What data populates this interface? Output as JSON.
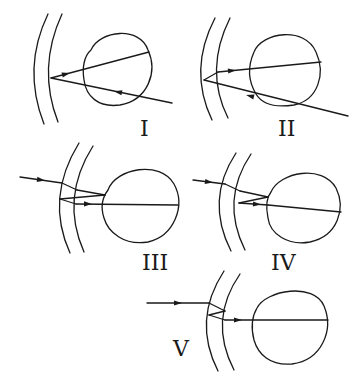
{
  "diagram": {
    "stroke_color": "#1a1a1a",
    "background": "#ffffff"
  },
  "panels": [
    {
      "id": "I",
      "label": "I",
      "label_pos": [
        140,
        136
      ],
      "lens_outer": "M 48 14 Q 22 68 44 124",
      "lens_inner": "M 62 14 Q 37 68 58 122",
      "eye": "M 91 50 C 100 30 140 26 148 50 C 158 72 148 100 120 105 C 98 108 86 96 84 80 C 82 68 84 56 91 50 Z",
      "rays": [
        "M 172 103 L 51 78",
        "M 51 78 L 149 52"
      ],
      "arrows": [
        {
          "x": 118,
          "y": 92,
          "angle": 191.7
        },
        {
          "x": 66,
          "y": 74,
          "angle": -15
        }
      ]
    },
    {
      "id": "II",
      "label": "II",
      "label_pos": [
        278,
        136
      ],
      "lens_outer": "M 215 18 Q 188 70 212 120",
      "lens_inner": "M 230 18 Q 204 70 228 118",
      "eye": "M 254 52 C 262 32 305 26 316 52 C 326 74 318 100 294 105 C 274 108 262 104 256 94 C 250 84 246 70 254 52 Z",
      "rays": [
        "M 348 116 L 204 80",
        "M 204 80 L 218 72",
        "M 218 72 L 321 62"
      ],
      "arrows": [
        {
          "x": 250,
          "y": 96,
          "angle": 194
        },
        {
          "x": 232,
          "y": 70.6,
          "angle": -5.5
        }
      ]
    },
    {
      "id": "III",
      "label": "III",
      "label_pos": [
        142,
        270
      ],
      "lens_outer": "M 79 143 Q 45 198 70 253",
      "lens_inner": "M 93 146 Q 60 198 84 252",
      "eye": "M 108 190 C 116 168 160 160 174 184 C 186 206 174 236 148 242 C 124 246 108 232 104 218 C 100 206 102 198 108 190 Z",
      "rays": [
        "M 20 177 L 62 183",
        "M 62 183 L 77 190",
        "M 77 190 L 105 195",
        "M 105 195 L 60 199",
        "M 60 199 L 76 204",
        "M 76 204 L 178 205"
      ],
      "arrows": [
        {
          "x": 41,
          "y": 180,
          "angle": 8
        },
        {
          "x": 88,
          "y": 204,
          "angle": 0.5
        }
      ]
    },
    {
      "id": "IV",
      "label": "IV",
      "label_pos": [
        271,
        270
      ],
      "lens_outer": "M 236 153 Q 205 200 231 251",
      "lens_inner": "M 251 154 Q 220 200 245 250",
      "eye": "M 271 192 C 280 172 322 164 336 188 C 346 208 338 236 310 242 C 288 246 270 234 268 218 C 266 208 266 198 271 192 Z",
      "rays": [
        "M 193 180 L 225 184",
        "M 225 184 L 240 191",
        "M 240 191 L 268 197",
        "M 268 197 L 239 203",
        "M 239 203 L 268 205",
        "M 268 205 L 341 212"
      ],
      "arrows": [
        {
          "x": 209,
          "y": 182,
          "angle": 7
        },
        {
          "x": 257,
          "y": 204.3,
          "angle": 4
        }
      ]
    },
    {
      "id": "V",
      "label": "V",
      "label_pos": [
        173,
        356
      ],
      "lens_outer": "M 224 271 Q 192 320 218 371",
      "lens_inner": "M 240 274 Q 208 320 234 370",
      "eye": "M 257 308 C 266 290 314 282 324 306 C 334 330 322 360 292 364 C 270 366 258 354 254 340 C 251 328 251 318 257 308 Z",
      "rays": [
        "M 147 303 L 209 303",
        "M 209 303 L 225 311",
        "M 225 311 L 209 315",
        "M 209 315 L 225 320",
        "M 225 320 L 328 320"
      ],
      "arrows": [
        {
          "x": 178,
          "y": 303,
          "angle": 0
        },
        {
          "x": 238,
          "y": 320,
          "angle": 0
        }
      ]
    }
  ]
}
